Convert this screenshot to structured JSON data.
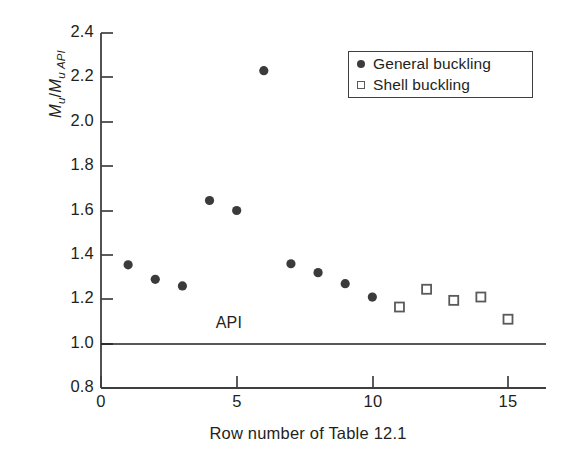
{
  "chart_data": {
    "type": "scatter",
    "title": "",
    "xlabel": "Row number of Table 12.1",
    "ylabel": "M_u/M_u API",
    "ylabel_parts": {
      "m1": "M",
      "sub1": "u",
      "slash": "/",
      "m2": "M",
      "sub2": "u API"
    },
    "xlim": [
      0,
      16
    ],
    "ylim": [
      0.8,
      2.4
    ],
    "xticks": [
      0,
      5,
      10,
      15
    ],
    "xtick_labels": [
      "0",
      "5",
      "10",
      "15"
    ],
    "yticks": [
      0.8,
      1.0,
      1.2,
      1.4,
      1.6,
      1.8,
      2.0,
      2.2,
      2.4
    ],
    "ytick_labels": [
      "0.8",
      "1.0",
      "1.2",
      "1.4",
      "1.6",
      "1.8",
      "2.0",
      "2.2",
      "2.4"
    ],
    "grid": false,
    "reference_line": {
      "label": "API",
      "y": 1.0
    },
    "legend_position": "top-right",
    "series": [
      {
        "name": "General buckling",
        "marker": "filled-circle",
        "color": "#3b3b3b",
        "x": [
          1,
          2,
          3,
          4,
          5,
          6,
          7,
          8,
          9,
          10
        ],
        "y": [
          1.355,
          1.29,
          1.26,
          1.645,
          1.6,
          2.23,
          1.36,
          1.32,
          1.27,
          1.21
        ]
      },
      {
        "name": "Shell buckling",
        "marker": "open-square",
        "color": "#5a5a5a",
        "x": [
          11,
          12,
          13,
          14,
          15
        ],
        "y": [
          1.165,
          1.245,
          1.195,
          1.21,
          1.11
        ]
      }
    ]
  },
  "legend": {
    "items": [
      {
        "label": "General buckling",
        "marker": "filled-circle"
      },
      {
        "label": "Shell buckling",
        "marker": "open-square"
      }
    ]
  },
  "axes": {
    "api_label": "API",
    "x_axis_title": "Row number of Table 12.1"
  },
  "colors": {
    "axis": "#3f3f3f",
    "marker_fill": "#3b3b3b",
    "marker_stroke": "#5a5a5a",
    "text": "#231f20",
    "background": "#ffffff"
  }
}
